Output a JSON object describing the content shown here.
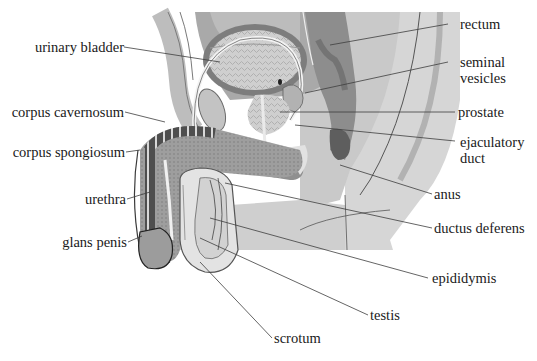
{
  "diagram": {
    "type": "anatomical sagittal section",
    "palette": {
      "background": "#ffffff",
      "body_light": "#d9d9d9",
      "body_mid": "#bdbdbd",
      "body_dark": "#8c8c8c",
      "tissue_darkest": "#5a5a5a",
      "outline": "#3a3a3a",
      "label_text": "#1a1a1a",
      "leader_line": "#444444"
    },
    "labels_left": [
      {
        "id": "urinary-bladder",
        "text": "urinary bladder"
      },
      {
        "id": "corpus-cavernosum",
        "text": "corpus cavernosum"
      },
      {
        "id": "corpus-spongiosum",
        "text": "corpus spongiosum"
      },
      {
        "id": "urethra",
        "text": "urethra"
      },
      {
        "id": "glans-penis",
        "text": "glans penis"
      }
    ],
    "labels_right": [
      {
        "id": "rectum",
        "text": "rectum"
      },
      {
        "id": "seminal-vesicles",
        "text": "seminal vesicles",
        "line1": "seminal",
        "line2": "vesicles"
      },
      {
        "id": "prostate",
        "text": "prostate"
      },
      {
        "id": "ejaculatory-duct",
        "text": "ejaculatory duct",
        "line1": "ejaculatory",
        "line2": "duct"
      },
      {
        "id": "anus",
        "text": "anus"
      },
      {
        "id": "ductus-deferens",
        "text": "ductus deferens"
      },
      {
        "id": "epididymis",
        "text": "epididymis"
      }
    ],
    "labels_bottom": [
      {
        "id": "testis",
        "text": "testis"
      },
      {
        "id": "scrotum",
        "text": "scrotum"
      }
    ]
  }
}
